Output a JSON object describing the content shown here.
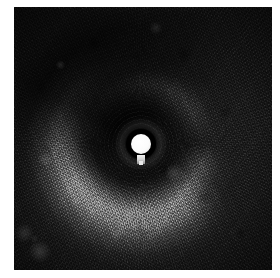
{
  "page": {
    "background_color": "#ffffff",
    "width": 280,
    "height": 278
  },
  "image": {
    "kind": "grayscale-ultrasound-cross-section",
    "modality_name": "IVUS",
    "alt_text": "Grayscale intravascular ultrasound cross-sectional image",
    "frame": {
      "left": 14,
      "top": 7,
      "width": 258,
      "height": 263
    },
    "border_color": "#ffffff",
    "palette": {
      "background": "#ffffff",
      "field_dark": "#0d0d0d",
      "field_mid": "#2a2a2a",
      "tissue_bright": "#c8c8c8",
      "catheter_core": "#ffffff",
      "catheter_ring": "#000000"
    },
    "catheter": {
      "label": "catheter-core",
      "center_x_pct": 49.2,
      "center_y_pct": 52.2,
      "core_diameter_px": 20,
      "ring_diameter_px": 30
    },
    "regions": [
      {
        "name": "upper-left-bright-arc",
        "brightness": "high"
      },
      {
        "name": "left-bright-arc",
        "brightness": "high"
      },
      {
        "name": "lower-left-bright-arc",
        "brightness": "medium-high"
      },
      {
        "name": "top-plaque-cap",
        "brightness": "medium"
      },
      {
        "name": "right-shadow-sector",
        "brightness": "low"
      },
      {
        "name": "lower-right-speckle",
        "brightness": "low"
      },
      {
        "name": "peri-catheter-lumen",
        "brightness": "low"
      }
    ]
  }
}
